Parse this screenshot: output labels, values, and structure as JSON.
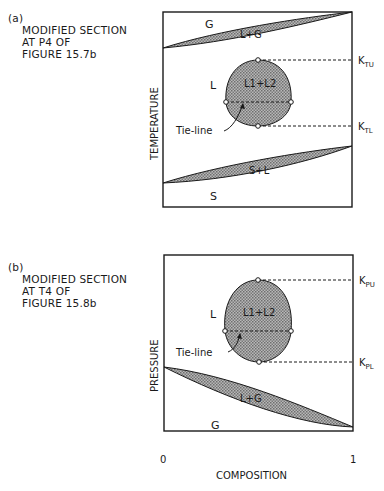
{
  "panel_a": {
    "tag": "(a)",
    "caption_lines": [
      "MODIFIED SECTION",
      "AT P4 OF",
      "FIGURE 15.7b"
    ],
    "y_axis_label": "TEMPERATURE",
    "regions": {
      "gas": "G",
      "liquid_gas": "L+G",
      "liquid": "L",
      "two_liquid": "L1+L2",
      "solid_liquid": "S+L",
      "solid": "S"
    },
    "tie_line_label": "Tie-line",
    "upper_point_label": "K",
    "upper_point_sub": "TU",
    "lower_point_label": "K",
    "lower_point_sub": "TL"
  },
  "panel_b": {
    "tag": "(b)",
    "caption_lines": [
      "MODIFIED SECTION",
      "AT T4 OF",
      "FIGURE 15.8b"
    ],
    "y_axis_label": "PRESSURE",
    "regions": {
      "liquid": "L",
      "two_liquid": "L1+L2",
      "liquid_gas": "L+G",
      "gas": "G"
    },
    "tie_line_label": "Tie-line",
    "upper_point_label": "K",
    "upper_point_sub": "PU",
    "lower_point_label": "K",
    "lower_point_sub": "PL"
  },
  "x_axis": {
    "label": "COMPOSITION",
    "tick_min": "0",
    "tick_max": "1"
  },
  "colors": {
    "line": "#1a1a1a",
    "fill": "#9a9a9a"
  }
}
